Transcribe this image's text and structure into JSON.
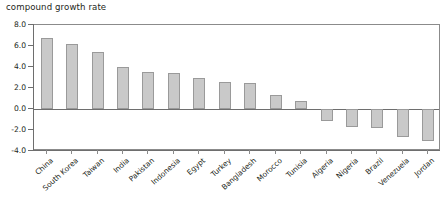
{
  "chart_data": {
    "type": "bar",
    "title": "compound growth rate",
    "xlabel": "",
    "ylabel": "",
    "ylim": [
      -4.0,
      8.0
    ],
    "ytick_values": [
      8.0,
      6.0,
      4.0,
      2.0,
      0.0,
      -2.0,
      -4.0
    ],
    "ytick_labels": [
      "8.0",
      "6.0",
      "4.0",
      "2.0",
      "0.0",
      "-2.0",
      "-4.0"
    ],
    "grid": false,
    "legend": "none",
    "orientation": "vertical",
    "bar_color": "#c9c9c9",
    "bar_edge_color": "#9a9a9a",
    "axis_color": "#6e6e6e",
    "categories": [
      "China",
      "South Korea",
      "Taiwan",
      "India",
      "Pakistan",
      "Indonesia",
      "Egypt",
      "Turkey",
      "Bangladesh",
      "Morocco",
      "Tunisia",
      "Algeria",
      "Nigeria",
      "Brazil",
      "Venezuela",
      "Jordan"
    ],
    "values": [
      6.8,
      6.2,
      5.4,
      4.0,
      3.5,
      3.4,
      3.0,
      2.6,
      2.5,
      1.3,
      0.8,
      -1.1,
      -1.7,
      -1.8,
      -2.7,
      -3.0
    ]
  }
}
